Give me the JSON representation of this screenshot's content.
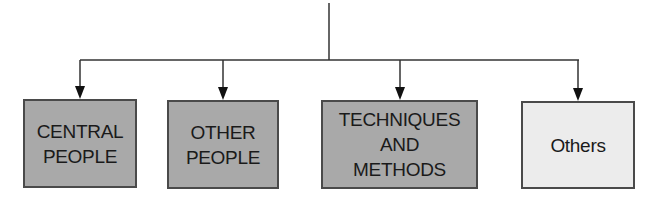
{
  "diagram": {
    "type": "hierarchy",
    "root": {
      "label": ""
    },
    "children": [
      {
        "label": "CENTRAL\nPEOPLE",
        "style": "dark"
      },
      {
        "label": "OTHER\nPEOPLE",
        "style": "dark"
      },
      {
        "label": "TECHNIQUES\nAND\nMETHODS",
        "style": "dark"
      },
      {
        "label": "Others",
        "style": "light"
      }
    ],
    "colors": {
      "dark_fill": "#a9a9a9",
      "light_fill": "#ececec",
      "border": "#4a4a4a",
      "connector": "#333333",
      "text": "#1a1a1a"
    }
  }
}
